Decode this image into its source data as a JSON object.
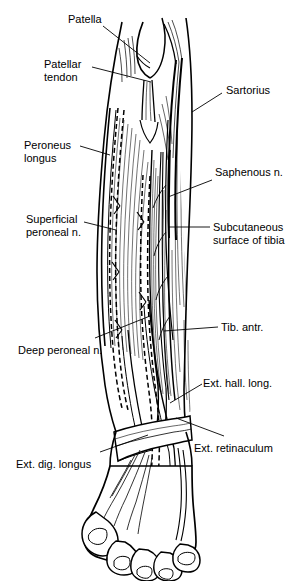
{
  "figure": {
    "view": "anterior",
    "style": "black-and-white line drawing",
    "line_color": "#000000",
    "background_color": "#ffffff"
  },
  "labels": [
    {
      "id": "patella",
      "text": "Patella",
      "lines": [
        "Patella"
      ],
      "side": "left",
      "x": 68,
      "y": 13
    },
    {
      "id": "patellar-tendon",
      "text": "Patellar tendon",
      "lines": [
        "Patellar",
        "tendon"
      ],
      "side": "left",
      "x": 44,
      "y": 58
    },
    {
      "id": "peroneus-longus",
      "text": "Peroneus longus",
      "lines": [
        "Peroneus",
        "longus"
      ],
      "side": "left",
      "x": 24,
      "y": 139
    },
    {
      "id": "superficial-peroneal-n",
      "text": "Superficial peroneal n.",
      "lines": [
        "Superficial",
        "peroneal n."
      ],
      "side": "left",
      "x": 26,
      "y": 219
    },
    {
      "id": "deep-peroneal-n",
      "text": "Deep peroneal n.",
      "lines": [
        "Deep peroneal n."
      ],
      "side": "left",
      "x": 20,
      "y": 344
    },
    {
      "id": "ext-dig-longus",
      "text": "Ext. dig. longus",
      "lines": [
        "Ext. dig. longus"
      ],
      "side": "left",
      "x": 18,
      "y": 458
    },
    {
      "id": "sartorius",
      "text": "Sartorius",
      "lines": [
        "Sartorius"
      ],
      "side": "right",
      "x": 226,
      "y": 84
    },
    {
      "id": "saphenous-n",
      "text": "Saphenous n.",
      "lines": [
        "Saphenous n."
      ],
      "side": "right",
      "x": 215,
      "y": 167
    },
    {
      "id": "subcutaneous-surface-of-tibia",
      "text": "Subcutaneous surface of tibia",
      "lines": [
        "Subcutaneous",
        "surface of tibia"
      ],
      "side": "right",
      "x": 213,
      "y": 221
    },
    {
      "id": "tib-antr",
      "text": "Tib. antr.",
      "lines": [
        "Tib. antr."
      ],
      "side": "right",
      "x": 221,
      "y": 322
    },
    {
      "id": "ext-hall-long",
      "text": "Ext. hall. long.",
      "lines": [
        "Ext. hall. long."
      ],
      "side": "right",
      "x": 205,
      "y": 377
    },
    {
      "id": "ext-retinaculum",
      "text": "Ext. retinaculum",
      "lines": [
        "Ext. retinaculum"
      ],
      "side": "right",
      "x": 196,
      "y": 442
    }
  ],
  "structures": [
    "patella",
    "patellar tendon",
    "peroneus longus",
    "superficial peroneal nerve",
    "deep peroneal nerve",
    "extensor digitorum longus",
    "sartorius",
    "saphenous nerve",
    "subcutaneous surface of tibia",
    "tibialis anterior",
    "extensor hallucis longus",
    "extensor retinaculum"
  ]
}
